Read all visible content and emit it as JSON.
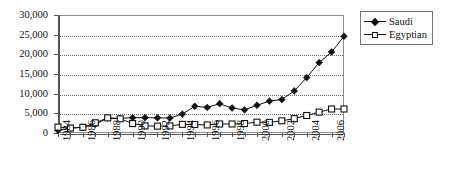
{
  "chart_data": {
    "type": "line",
    "title": "",
    "xlabel": "",
    "ylabel": "",
    "x": [
      1984,
      1985,
      1986,
      1987,
      1988,
      1989,
      1990,
      1991,
      1992,
      1993,
      1994,
      1995,
      1996,
      1997,
      1998,
      1999,
      2000,
      2001,
      2002,
      2003,
      2004,
      2005,
      2006,
      2007
    ],
    "xlim": [
      1984,
      2007
    ],
    "ylim": [
      0,
      30000
    ],
    "ytick_values": [
      0,
      5000,
      10000,
      15000,
      20000,
      25000,
      30000
    ],
    "ytick_labels": [
      "0",
      "5,000",
      "10,000",
      "15,000",
      "20,000",
      "25,000",
      "30,000"
    ],
    "xtick_labels": [
      "1984",
      "1986",
      "1988",
      "1990",
      "1992",
      "1994",
      "1996",
      "1998",
      "2000",
      "2002",
      "2004",
      "2006"
    ],
    "xtick_label_years": [
      1984,
      1986,
      1988,
      1990,
      1992,
      1994,
      1996,
      1998,
      2000,
      2002,
      2004,
      2006
    ],
    "grid": true,
    "grid_axis": "y",
    "legend_position": "top-right",
    "series": [
      {
        "name": "Saudi",
        "marker": "filled-diamond",
        "color": "#111111",
        "values": [
          700,
          1200,
          1500,
          2200,
          3800,
          3700,
          3900,
          3900,
          3850,
          3800,
          4800,
          6800,
          6500,
          7450,
          6350,
          5900,
          7050,
          8100,
          8500,
          10700,
          14100,
          17900,
          20600,
          24600
        ]
      },
      {
        "name": "Egyptian",
        "marker": "open-square",
        "color": "#111111",
        "values": [
          1500,
          1250,
          1450,
          2600,
          3850,
          3600,
          2400,
          1800,
          1750,
          1800,
          2200,
          2150,
          2050,
          2300,
          2300,
          2400,
          2750,
          2700,
          3100,
          3650,
          4450,
          5300,
          6100,
          6100
        ]
      }
    ]
  },
  "legend": {
    "items": [
      {
        "label": "Saudi",
        "marker": "filled-diamond"
      },
      {
        "label": "Egyptian",
        "marker": "open-square"
      }
    ]
  }
}
